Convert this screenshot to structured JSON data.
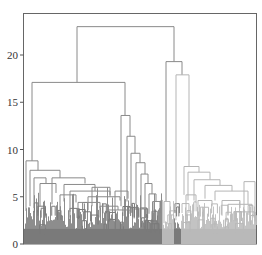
{
  "chart_data": {
    "type": "dendrogram",
    "title": "",
    "xlabel": "",
    "ylabel": "",
    "ylim": [
      0,
      24.3
    ],
    "yticks": [
      0,
      5,
      10,
      15,
      20
    ],
    "ytick_labels": [
      "0",
      "5",
      "10",
      "15",
      "20"
    ],
    "grid": false,
    "legend": null,
    "colors": {
      "cluster_dark": "#7a7a7a",
      "cluster_light": "#b9b9b9",
      "upper_links": "#8c8c8c",
      "axis": "#555555"
    },
    "merges": [
      {
        "name": "root",
        "height": 23.0,
        "left": "A",
        "right": "B"
      },
      {
        "name": "A",
        "height": 17.1,
        "left": "A1",
        "right": "A2"
      },
      {
        "name": "B",
        "height": 19.3,
        "left": "B1",
        "right": "B2"
      },
      {
        "name": "B2",
        "height": 17.9,
        "left": "B2a",
        "right": "B2b"
      },
      {
        "name": "A2",
        "height": 13.6,
        "left": "A2a",
        "right": "A2b"
      },
      {
        "name": "A1",
        "height": 8.8,
        "left": "A1a",
        "right": "A1b"
      },
      {
        "name": "A2b",
        "height": 11.5
      },
      {
        "name": "A2b-2",
        "height": 9.4
      },
      {
        "name": "B2b",
        "height": 8.0
      },
      {
        "name": "B2b-2",
        "height": 6.8
      },
      {
        "name": "B2b-3",
        "height": 5.6
      },
      {
        "name": "A1-sub1",
        "height": 7.8
      },
      {
        "name": "A1-sub2",
        "height": 7.0
      },
      {
        "name": "A1-sub3",
        "height": 6.3
      },
      {
        "name": "A1-sub4",
        "height": 5.4
      },
      {
        "name": "A1-sub5",
        "height": 4.8
      },
      {
        "name": "A1-sub6",
        "height": 4.2
      }
    ],
    "clusters": [
      {
        "name": "left-dark",
        "color": "#7a7a7a",
        "x_range_px": [
          24,
          162
        ]
      },
      {
        "name": "mid-light",
        "color": "#b9b9b9",
        "x_range_px": [
          162,
          174
        ]
      },
      {
        "name": "mid-dark",
        "color": "#7a7a7a",
        "x_range_px": [
          174,
          181
        ]
      },
      {
        "name": "right-light",
        "color": "#b9b9b9",
        "x_range_px": [
          181,
          256
        ]
      }
    ]
  }
}
